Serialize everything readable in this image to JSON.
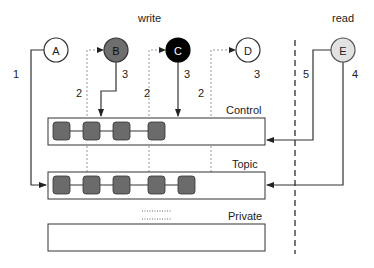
{
  "headers": {
    "write": "write",
    "read": "read"
  },
  "nodes": [
    {
      "id": "A",
      "label": "A",
      "fill": "#ffffff",
      "text": "#222222"
    },
    {
      "id": "B",
      "label": "B",
      "fill": "#6e6e6e",
      "text": "#111111"
    },
    {
      "id": "C",
      "label": "C",
      "fill": "#000000",
      "text": "#ffffff"
    },
    {
      "id": "D",
      "label": "D",
      "fill": "#ffffff",
      "text": "#222222"
    },
    {
      "id": "E",
      "label": "E",
      "fill": "#e2e2e2",
      "text": "#222222"
    }
  ],
  "edge_labels": {
    "a_to_topic": "1",
    "b_dotted": "2",
    "b_to_control": "3",
    "c_dotted": "2",
    "c_to_control": "3",
    "d_dotted": "2",
    "d_num": "3",
    "e_to_control": "5",
    "e_to_topic": "4"
  },
  "buffers": {
    "control": {
      "label": "Control",
      "cells": 4
    },
    "topic": {
      "label": "Topic",
      "cells": 5
    },
    "private": {
      "label": "Private",
      "cells": 0
    }
  },
  "colors": {
    "cell_fill": "#6b6b6b",
    "line": "#333333",
    "dotted": "#999999"
  }
}
